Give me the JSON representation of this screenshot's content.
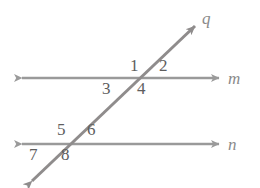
{
  "figure": {
    "type": "geometry-diagram",
    "background_color": "#ffffff",
    "line_color": "#9a9a9a",
    "transversal_color": "#8f8c8c",
    "number_color": "#5e5e5e",
    "label_color": "#8a8a8a"
  },
  "lines": [
    {
      "name": "m",
      "label": "m",
      "kind": "horizontal",
      "arrowheads": "both",
      "x1": 22,
      "y1": 78,
      "x2": 219,
      "y2": 78,
      "label_x": 228,
      "label_y": 70
    },
    {
      "name": "n",
      "label": "n",
      "kind": "horizontal",
      "arrowheads": "both",
      "x1": 22,
      "y1": 144,
      "x2": 219,
      "y2": 144,
      "label_x": 228,
      "label_y": 136
    },
    {
      "name": "q",
      "label": "q",
      "kind": "transversal",
      "arrowheads": "both",
      "x1": 32,
      "y1": 181,
      "x2": 195,
      "y2": 26,
      "label_x": 202,
      "label_y": 10
    }
  ],
  "intersections": [
    {
      "name": "m-q",
      "x": 145,
      "y": 78
    },
    {
      "name": "n-q",
      "x": 71,
      "y": 144
    }
  ],
  "angles": [
    {
      "id": "1",
      "label": "1",
      "x": 130,
      "y": 57,
      "at": "m-q",
      "position": "upper-left"
    },
    {
      "id": "2",
      "label": "2",
      "x": 159,
      "y": 57,
      "at": "m-q",
      "position": "upper-right"
    },
    {
      "id": "3",
      "label": "3",
      "x": 102,
      "y": 80,
      "at": "m-q",
      "position": "lower-left"
    },
    {
      "id": "4",
      "label": "4",
      "x": 137,
      "y": 80,
      "at": "m-q",
      "position": "lower-right"
    },
    {
      "id": "5",
      "label": "5",
      "x": 57,
      "y": 121,
      "at": "n-q",
      "position": "upper-left"
    },
    {
      "id": "6",
      "label": "6",
      "x": 87,
      "y": 121,
      "at": "n-q",
      "position": "upper-right"
    },
    {
      "id": "7",
      "label": "7",
      "x": 29,
      "y": 146,
      "at": "n-q",
      "position": "lower-left"
    },
    {
      "id": "8",
      "label": "8",
      "x": 61,
      "y": 146,
      "at": "n-q",
      "position": "lower-right"
    }
  ]
}
